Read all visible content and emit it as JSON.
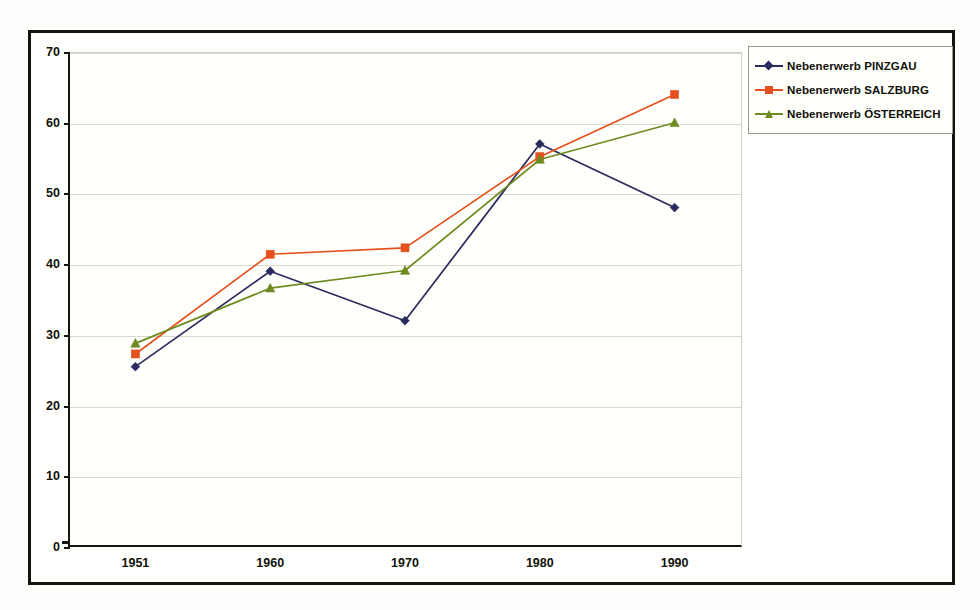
{
  "chart_data": {
    "type": "line",
    "title": "",
    "subtitle": "",
    "xlabel": "",
    "ylabel": "",
    "categories": [
      "1951",
      "1960",
      "1970",
      "1980",
      "1990"
    ],
    "ylim": [
      0,
      70
    ],
    "yticks": [
      0,
      10,
      20,
      30,
      40,
      50,
      60,
      70
    ],
    "grid": true,
    "legend_position": "top-right-outside",
    "series": [
      {
        "name": "Nebenerwerb  PINZGAU",
        "color": "#2b2a5e",
        "marker": "diamond",
        "values": [
          25.5,
          39.0,
          32.0,
          57.0,
          48.0
        ]
      },
      {
        "name": "Nebenerwerb  SALZBURG",
        "color": "#e4511e",
        "marker": "square",
        "values": [
          27.3,
          41.4,
          42.3,
          55.2,
          64.0
        ]
      },
      {
        "name": "Nebenerwerb  ÖSTERREICH",
        "color": "#6e8b20",
        "marker": "triangle",
        "values": [
          28.8,
          36.6,
          39.1,
          54.8,
          60.0
        ]
      }
    ]
  },
  "figure": {
    "background_color": "#fffffd",
    "frame_color": "#14140f",
    "axis_color": "#16160f",
    "gridline_color": "#d8d8cc"
  }
}
